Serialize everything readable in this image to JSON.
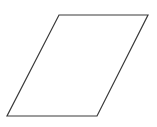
{
  "diagram": {
    "shape": "parallelogram",
    "meaning": "flowchart-data-input-output",
    "stroke_color": "#3a3a3a",
    "fill_color": "#ffffff",
    "stroke_width": 1.2,
    "points": [
      [
        59,
        15
      ],
      [
        148,
        15
      ],
      [
        97,
        116
      ],
      [
        7,
        116
      ]
    ],
    "label": ""
  }
}
